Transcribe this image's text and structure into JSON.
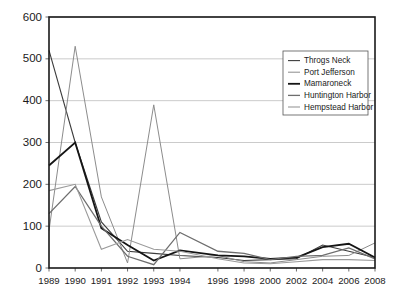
{
  "chart_data": {
    "type": "line",
    "title": "",
    "subtitle": "",
    "xlabel": "",
    "ylabel": "",
    "ylim": [
      0,
      600
    ],
    "ytick_values": [
      0,
      100,
      200,
      300,
      400,
      500,
      600
    ],
    "ytick_labels": [
      "0",
      "100",
      "200",
      "300",
      "400",
      "500",
      "600"
    ],
    "grid": true,
    "legend_position": "upper-right",
    "categories": [
      "1989",
      "1990",
      "1991",
      "1992",
      "1993",
      "1994",
      "1996",
      "1998",
      "2000",
      "2002",
      "2004",
      "2006",
      "2008"
    ],
    "series": [
      {
        "name": "Throgs Neck",
        "color": "#3c3c3c",
        "line_width": 1.1,
        "values": [
          520,
          300,
          110,
          40,
          35,
          30,
          25,
          18,
          20,
          22,
          55,
          40,
          25
        ]
      },
      {
        "name": "Port Jefferson",
        "color": "#8c8c8c",
        "line_width": 1.0,
        "values": [
          90,
          530,
          170,
          12,
          390,
          22,
          30,
          15,
          12,
          20,
          28,
          30,
          60
        ]
      },
      {
        "name": "Mamaroneck",
        "color": "#151515",
        "line_width": 1.8,
        "values": [
          245,
          300,
          95,
          55,
          18,
          42,
          30,
          28,
          22,
          25,
          50,
          58,
          25
        ]
      },
      {
        "name": "Huntington Harbor",
        "color": "#6e6e6e",
        "line_width": 1.3,
        "values": [
          130,
          195,
          100,
          28,
          8,
          85,
          40,
          35,
          20,
          28,
          30,
          48,
          22
        ]
      },
      {
        "name": "Hempstead Harbor",
        "color": "#9a9a9a",
        "line_width": 1.1,
        "values": [
          185,
          200,
          45,
          68,
          45,
          40,
          22,
          12,
          10,
          15,
          20,
          20,
          18
        ]
      }
    ]
  },
  "legend": {
    "entries": [
      {
        "label": "Throgs Neck"
      },
      {
        "label": "Port Jefferson"
      },
      {
        "label": "Mamaroneck"
      },
      {
        "label": "Huntington Harbor"
      },
      {
        "label": "Hempstead Harbor"
      }
    ]
  }
}
